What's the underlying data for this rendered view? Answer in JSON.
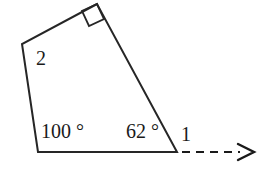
{
  "figure": {
    "kind": "geometry-diagram",
    "background_color": "#ffffff",
    "stroke_color": "#262626",
    "text_color": "#1a1a1a",
    "labels": {
      "angle_left": "100 °",
      "angle_right": "62 °",
      "side_one": "1",
      "side_two": "2"
    },
    "shape": {
      "name": "quadrilateral",
      "vertices": [
        {
          "name": "top-vertex",
          "x": 97,
          "y": 4
        },
        {
          "name": "left-vertex",
          "x": 22,
          "y": 44
        },
        {
          "name": "bottom-left-vertex",
          "x": 38,
          "y": 152
        },
        {
          "name": "bottom-right-vertex",
          "x": 177,
          "y": 152
        }
      ]
    },
    "markers": {
      "right_angle_square": {
        "name": "right-angle-marker",
        "points": "97,4 82,11 89,26 104,19"
      }
    },
    "ray": {
      "name": "dashed-ray",
      "x1": 182,
      "y1": 152,
      "x2": 240,
      "y2": 152,
      "dash_pattern": "8,6",
      "arrowhead": "238,144 254,152 238,160"
    }
  }
}
